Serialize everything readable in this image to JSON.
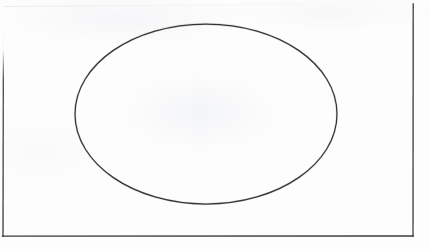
{
  "document": {
    "kind": "scanned-hand-drawn-figure",
    "canvas_width": 430,
    "canvas_height": 249,
    "background_color": "#fdfdfd",
    "ink_color": "#2a2a2a",
    "caption": ""
  },
  "shapes": {
    "frame": {
      "name": "rectangular-border",
      "description": "Rectangular frame; left, right and bottom edges inked, top edge faded away",
      "stroke_color": "#3a3a3a",
      "stroke_width": 1.3,
      "left_x": 3,
      "right_x": 413,
      "bottom_y": 236,
      "top_y": 4,
      "left_visible_from_y": 40,
      "top_edge_visible": false
    },
    "ellipse": {
      "name": "ellipse",
      "description": "Large hand-drawn ellipse centered in the frame",
      "stroke_color": "#262626",
      "stroke_width": 1.25,
      "fill": "none",
      "center_x": 206,
      "center_y": 114,
      "radius_x": 131,
      "radius_y": 90,
      "left_x": 75,
      "right_x": 337,
      "top_y": 24,
      "bottom_y": 204
    }
  }
}
